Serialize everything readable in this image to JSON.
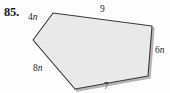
{
  "problem": {
    "number": "85."
  },
  "figure": {
    "type": "polygon",
    "shape_name": "pentagon",
    "fill_color": "#e9e9e9",
    "stroke_color": "#3a3a3a",
    "shadow_color": "#b5b5b5",
    "vertices": [
      {
        "name": "top-left",
        "x": 53,
        "y": 13
      },
      {
        "name": "top-right",
        "x": 152,
        "y": 26
      },
      {
        "name": "bottom-right",
        "x": 148,
        "y": 76
      },
      {
        "name": "bottom",
        "x": 75,
        "y": 89
      },
      {
        "name": "left",
        "x": 33,
        "y": 40
      }
    ],
    "side_labels": [
      {
        "id": "top",
        "text": "9",
        "number": "9",
        "variable": "",
        "position": "above-top-edge"
      },
      {
        "id": "right",
        "text": "6n",
        "number": "6",
        "variable": "n",
        "position": "right-of-right-edge"
      },
      {
        "id": "upper-left",
        "text": "4n",
        "number": "4",
        "variable": "n",
        "position": "left-of-upper-left-edge"
      },
      {
        "id": "lower-left",
        "text": "8n",
        "number": "8",
        "variable": "n",
        "position": "left-of-lower-left-edge"
      },
      {
        "id": "bottom",
        "text": "7",
        "number": "7",
        "variable": "",
        "position": "below-bottom-edge"
      }
    ]
  }
}
